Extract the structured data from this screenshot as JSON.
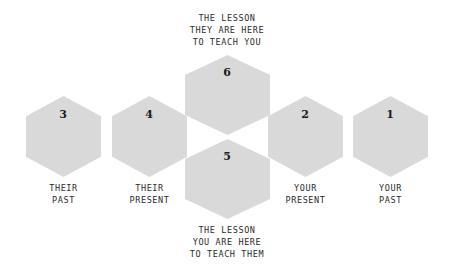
{
  "diagram": {
    "hex_fill_color": "#d9d9d9",
    "background_color": "#ffffff",
    "text_color": "#2b2b2b",
    "hexagons": [
      {
        "id": "hex-1",
        "number": "1",
        "label_lines": [
          "YOUR",
          "PAST"
        ],
        "label_text": "YOUR PAST"
      },
      {
        "id": "hex-2",
        "number": "2",
        "label_lines": [
          "YOUR",
          "PRESENT"
        ],
        "label_text": "YOUR PRESENT"
      },
      {
        "id": "hex-3",
        "number": "3",
        "label_lines": [
          "THEIR",
          "PAST"
        ],
        "label_text": "THEIR PAST"
      },
      {
        "id": "hex-4",
        "number": "4",
        "label_lines": [
          "THEIR",
          "PRESENT"
        ],
        "label_text": "THEIR PRESENT"
      },
      {
        "id": "hex-5",
        "number": "5",
        "label_lines": [],
        "label_text": ""
      },
      {
        "id": "hex-6",
        "number": "6",
        "label_lines": [],
        "label_text": ""
      }
    ],
    "caption_top": {
      "lines": [
        "THE LESSON",
        "THEY ARE HERE",
        "TO TEACH YOU"
      ],
      "text": "THE LESSON THEY ARE HERE TO TEACH YOU"
    },
    "caption_bottom": {
      "lines": [
        "THE LESSON",
        "YOU ARE HERE",
        "TO TEACH THEM"
      ],
      "text": "THE LESSON YOU ARE HERE TO TEACH THEM"
    }
  }
}
